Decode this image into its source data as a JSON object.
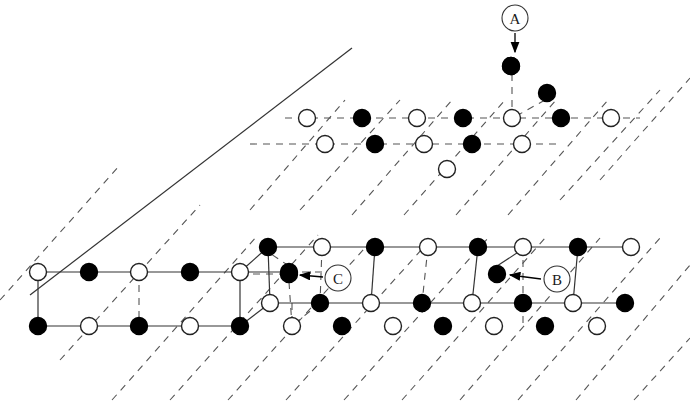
{
  "figure": {
    "title_fragment": "",
    "background_color": "#ffffff",
    "line_color": "#555555",
    "solid_line_color": "#333333",
    "filled_site_color": "#000000",
    "open_site_color": "#ffffff",
    "open_site_stroke": "#222222",
    "site_radius": 8.5,
    "callout_radius": 13
  },
  "callouts": [
    {
      "id": "A",
      "label": "A",
      "circle": {
        "x": 515,
        "y": 18
      },
      "arrow": {
        "x1": 515,
        "y1": 33,
        "x2": 515,
        "y2": 52
      },
      "target_site": {
        "x": 511,
        "y": 66,
        "fill": "filled"
      }
    },
    {
      "id": "B",
      "label": "B",
      "circle": {
        "x": 557,
        "y": 279
      },
      "arrow": {
        "x1": 541,
        "y1": 279,
        "x2": 510,
        "y2": 275
      },
      "target_site": {
        "x": 497,
        "y": 274,
        "fill": "filled"
      }
    },
    {
      "id": "C",
      "label": "C",
      "circle": {
        "x": 338,
        "y": 278
      },
      "arrow": {
        "x1": 323,
        "y1": 277,
        "x2": 300,
        "y2": 275
      },
      "target_site": {
        "x": 289,
        "y": 274,
        "fill": "filled"
      }
    }
  ],
  "lattice": {
    "upper_plane": {
      "row_front": {
        "y": 118,
        "sites": [
          {
            "x": 307,
            "fill": "open"
          },
          {
            "x": 362,
            "fill": "filled"
          },
          {
            "x": 417,
            "fill": "open"
          },
          {
            "x": 463,
            "fill": "filled"
          },
          {
            "x": 512,
            "fill": "open"
          },
          {
            "x": 561,
            "fill": "filled"
          },
          {
            "x": 611,
            "fill": "open"
          }
        ]
      },
      "row_back": {
        "y": 144,
        "sites": [
          {
            "x": 325,
            "fill": "open"
          },
          {
            "x": 375,
            "fill": "filled"
          },
          {
            "x": 424,
            "fill": "open"
          },
          {
            "x": 472,
            "fill": "filled"
          },
          {
            "x": 522,
            "fill": "open"
          }
        ]
      },
      "extra_sites": [
        {
          "x": 511,
          "y": 66,
          "fill": "filled"
        },
        {
          "x": 547,
          "y": 93,
          "fill": "filled"
        },
        {
          "x": 447,
          "y": 169,
          "fill": "open"
        }
      ]
    },
    "lower_plane": {
      "row_back": {
        "y": 247,
        "sites": [
          {
            "x": 268,
            "fill": "filled"
          },
          {
            "x": 322,
            "fill": "open"
          },
          {
            "x": 375,
            "fill": "filled"
          },
          {
            "x": 428,
            "fill": "open"
          },
          {
            "x": 478,
            "fill": "filled"
          },
          {
            "x": 523,
            "fill": "open"
          },
          {
            "x": 578,
            "fill": "filled"
          },
          {
            "x": 631,
            "fill": "open"
          }
        ]
      },
      "row_middle": {
        "y": 272,
        "sites": [
          {
            "x": 38,
            "fill": "open"
          },
          {
            "x": 89,
            "fill": "filled"
          },
          {
            "x": 139,
            "fill": "open"
          },
          {
            "x": 190,
            "fill": "filled"
          },
          {
            "x": 240,
            "fill": "open"
          },
          {
            "x": 289,
            "fill": "filled"
          }
        ]
      },
      "row_front": {
        "y": 303,
        "sites": [
          {
            "x": 270,
            "fill": "open"
          },
          {
            "x": 320,
            "fill": "filled"
          },
          {
            "x": 371,
            "fill": "open"
          },
          {
            "x": 422,
            "fill": "filled"
          },
          {
            "x": 472,
            "fill": "open"
          },
          {
            "x": 523,
            "fill": "filled"
          },
          {
            "x": 573,
            "fill": "open"
          },
          {
            "x": 625,
            "fill": "filled"
          }
        ]
      },
      "row_bottom": {
        "y": 326,
        "sites": [
          {
            "x": 38,
            "fill": "filled"
          },
          {
            "x": 89,
            "fill": "open"
          },
          {
            "x": 139,
            "fill": "filled"
          },
          {
            "x": 190,
            "fill": "open"
          },
          {
            "x": 240,
            "fill": "filled"
          },
          {
            "x": 292,
            "fill": "open"
          },
          {
            "x": 342,
            "fill": "filled"
          },
          {
            "x": 393,
            "fill": "open"
          },
          {
            "x": 443,
            "fill": "filled"
          },
          {
            "x": 494,
            "fill": "open"
          },
          {
            "x": 545,
            "fill": "filled"
          },
          {
            "x": 597,
            "fill": "open"
          }
        ]
      }
    }
  },
  "counts": {
    "filled_sites": 30,
    "open_sites": 30,
    "callout_count": 3
  }
}
